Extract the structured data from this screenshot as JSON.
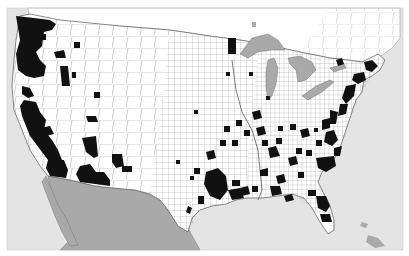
{
  "map": {
    "type": "choropleth",
    "region": "Contiguous United States (county level)",
    "colors": {
      "background": "#ffffff",
      "water": "#e4e4e4",
      "land": "#ffffff",
      "foreign_land": "#a9a9a9",
      "lakes": "#a9a9a9",
      "highlighted_county": "#111111",
      "county_border": "#6a6a6a"
    },
    "legend": null,
    "title": null,
    "highlight_regions": [
      "Pacific Northwest coast (WA/OR)",
      "Northern & Central California",
      "Southern California / Arizona border",
      "Southern Arizona / New Mexico",
      "Northern Minnesota",
      "Northeast corridor (Boston–Washington)",
      "Southeast scattered counties (GA, SC, NC, AL, MS, LA)",
      "East Texas / Houston",
      "Florida"
    ]
  }
}
